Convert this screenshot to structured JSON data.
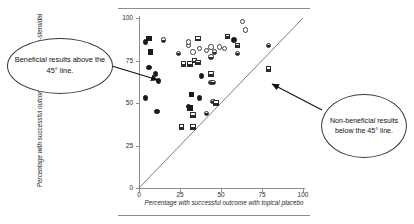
{
  "figure": {
    "callout_left": "Beneficial results above the 45° line.",
    "callout_right": "Non-beneficial results below the 45° line."
  },
  "chart_data": {
    "type": "scatter",
    "title": "",
    "xlabel": "Percentage with successful outcome with topical placebo",
    "ylabel": "Percentage with successful outcome with topical non-steroidal",
    "xlim": [
      0,
      100
    ],
    "ylim": [
      0,
      100
    ],
    "xticks": [
      0,
      25,
      50,
      75,
      100
    ],
    "yticks": [
      0,
      25,
      50,
      75,
      100
    ],
    "grid": false,
    "legend": "none",
    "reference_line": {
      "label": "45° line of equality",
      "from": [
        0,
        0
      ],
      "to": [
        100,
        100
      ]
    },
    "annotations": [
      {
        "text": "Beneficial results above the 45° line.",
        "points_to": [
          12,
          63
        ]
      },
      {
        "text": "Non-beneficial results below the 45° line.",
        "points_to": [
          79,
          70
        ]
      }
    ],
    "series": [
      {
        "name": "trial results",
        "points": [
          {
            "x": 4,
            "y": 86,
            "marker": "circle-filled"
          },
          {
            "x": 6,
            "y": 88,
            "marker": "square-filled"
          },
          {
            "x": 7,
            "y": 80,
            "marker": "square-filled"
          },
          {
            "x": 15,
            "y": 87,
            "marker": "circle-half"
          },
          {
            "x": 6,
            "y": 71,
            "marker": "circle-filled"
          },
          {
            "x": 10,
            "y": 67,
            "marker": "circle-filled"
          },
          {
            "x": 12,
            "y": 63,
            "marker": "circle-filled"
          },
          {
            "x": 4,
            "y": 53,
            "marker": "circle-filled"
          },
          {
            "x": 11,
            "y": 45,
            "marker": "circle-filled"
          },
          {
            "x": 24,
            "y": 79,
            "marker": "circle-half"
          },
          {
            "x": 30,
            "y": 84,
            "marker": "circle-open"
          },
          {
            "x": 30,
            "y": 86,
            "marker": "circle-open"
          },
          {
            "x": 27,
            "y": 73,
            "marker": "square-half"
          },
          {
            "x": 31,
            "y": 73,
            "marker": "square-half"
          },
          {
            "x": 34,
            "y": 75,
            "marker": "square-half"
          },
          {
            "x": 36,
            "y": 74,
            "marker": "square-half"
          },
          {
            "x": 33,
            "y": 80,
            "marker": "circle-open"
          },
          {
            "x": 37,
            "y": 82,
            "marker": "circle-open"
          },
          {
            "x": 41,
            "y": 81,
            "marker": "circle-open"
          },
          {
            "x": 44,
            "y": 83,
            "marker": "circle-open"
          },
          {
            "x": 46,
            "y": 80,
            "marker": "circle-half"
          },
          {
            "x": 49,
            "y": 83,
            "marker": "circle-open"
          },
          {
            "x": 52,
            "y": 82,
            "marker": "circle-open"
          },
          {
            "x": 44,
            "y": 77,
            "marker": "circle-half"
          },
          {
            "x": 36,
            "y": 88,
            "marker": "square-half"
          },
          {
            "x": 54,
            "y": 89,
            "marker": "square-half"
          },
          {
            "x": 58,
            "y": 87,
            "marker": "circle-filled"
          },
          {
            "x": 60,
            "y": 84,
            "marker": "square-half"
          },
          {
            "x": 63,
            "y": 98,
            "marker": "circle-open"
          },
          {
            "x": 65,
            "y": 93,
            "marker": "circle-open"
          },
          {
            "x": 60,
            "y": 79,
            "marker": "circle-half"
          },
          {
            "x": 38,
            "y": 66,
            "marker": "circle-filled"
          },
          {
            "x": 44,
            "y": 67,
            "marker": "square-half"
          },
          {
            "x": 44,
            "y": 62,
            "marker": "circle-half"
          },
          {
            "x": 45,
            "y": 62,
            "marker": "circle-half"
          },
          {
            "x": 32,
            "y": 55,
            "marker": "square-filled"
          },
          {
            "x": 37,
            "y": 53,
            "marker": "circle-filled"
          },
          {
            "x": 30,
            "y": 48,
            "marker": "circle-filled"
          },
          {
            "x": 31,
            "y": 47,
            "marker": "square-filled"
          },
          {
            "x": 45,
            "y": 51,
            "marker": "circle-half"
          },
          {
            "x": 47,
            "y": 50,
            "marker": "square-half"
          },
          {
            "x": 33,
            "y": 43,
            "marker": "square-half"
          },
          {
            "x": 41,
            "y": 44,
            "marker": "circle-half"
          },
          {
            "x": 26,
            "y": 36,
            "marker": "square-half"
          },
          {
            "x": 33,
            "y": 36,
            "marker": "square-half"
          },
          {
            "x": 79,
            "y": 84,
            "marker": "circle-half"
          },
          {
            "x": 79,
            "y": 70,
            "marker": "square-half"
          }
        ]
      }
    ]
  }
}
